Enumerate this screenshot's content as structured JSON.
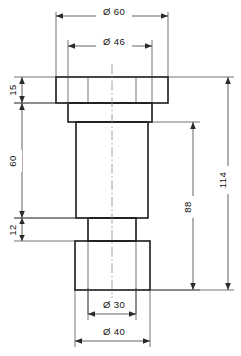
{
  "drawing": {
    "title": "Stepped cylindrical bushing - technical dimension drawing",
    "projection": "front-section-view",
    "units": "mm",
    "line_color": "#1a1a1a",
    "dim_color": "#3a3a3a",
    "center_color": "#8a8a8a",
    "background": "#ffffff"
  },
  "diameter_symbol": "Ø",
  "dimensions": {
    "top_outer": {
      "label": "Ø 60",
      "value": 60,
      "feature": "flange-outer-diameter",
      "placement": "top"
    },
    "top_inner": {
      "label": "Ø 46",
      "value": 46,
      "feature": "upper-step-diameter",
      "placement": "top"
    },
    "bottom_inner": {
      "label": "Ø 30",
      "value": 30,
      "feature": "lower-neck-diameter",
      "placement": "bottom"
    },
    "bottom_outer": {
      "label": "Ø 40",
      "value": 40,
      "feature": "bottom-boss-diameter",
      "placement": "bottom"
    },
    "left_top": {
      "label": "15",
      "value": 15,
      "feature": "flange-thickness",
      "placement": "left"
    },
    "left_middle": {
      "label": "60",
      "value": 60,
      "feature": "body-height",
      "placement": "left"
    },
    "left_bottom": {
      "label": "12",
      "value": 12,
      "feature": "neck-height",
      "placement": "left"
    },
    "right_inner": {
      "label": "88",
      "value": 88,
      "feature": "height-below-flange",
      "placement": "right"
    },
    "right_outer": {
      "label": "114",
      "value": 114,
      "feature": "overall-height",
      "placement": "right"
    }
  },
  "geometry": {
    "flange": {
      "name": "flange",
      "x": 56,
      "y": 77,
      "w": 112,
      "h": 26
    },
    "upper_step": {
      "name": "upper-step",
      "x": 68,
      "y": 103,
      "w": 84,
      "h": 19
    },
    "body": {
      "name": "main-body",
      "x": 76,
      "y": 122,
      "w": 72,
      "h": 96
    },
    "neck": {
      "name": "lower-neck",
      "x": 88,
      "y": 218,
      "w": 48,
      "h": 23
    },
    "boss": {
      "name": "bottom-boss",
      "x": 75,
      "y": 241,
      "w": 75,
      "h": 49
    },
    "centerline_x": 112
  }
}
